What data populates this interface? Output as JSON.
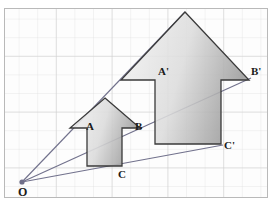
{
  "figure": {
    "background_color": "#ffffff",
    "frame": {
      "x": 4,
      "y": 8,
      "width": 264,
      "height": 190,
      "border_color": "#b8b8b8",
      "fill_color": "#fdfdfd"
    },
    "grid": {
      "spacing": 18.6,
      "line_color": "#dcdcdc",
      "major_line_color": "#cfcfcf",
      "visible": true
    },
    "center_point": {
      "label": "O",
      "x": 22,
      "y": 182,
      "dot_color": "#6f6f8a",
      "dot_radius": 2.6
    },
    "shapes": [
      {
        "name": "pre-image-arrow",
        "label_set": [
          "A",
          "B",
          "C"
        ],
        "stroke_color": "#3a3a3a",
        "fill_start": "#f2f2f2",
        "fill_end": "#9a9a9a",
        "points": "105,98 140,128 122,128 122,166 87,166 87,128 70,128",
        "vertices": {
          "A": {
            "x": 87,
            "y": 128
          },
          "B": {
            "x": 122,
            "y": 128
          },
          "C": {
            "x": 122,
            "y": 166
          }
        }
      },
      {
        "name": "image-arrow",
        "label_set": [
          "A'",
          "B'",
          "C'"
        ],
        "stroke_color": "#3a3a3a",
        "fill_start": "#f2f2f2",
        "fill_end": "#9a9a9a",
        "points": "185,12 249,80 221,80 221,144 155,144 155,80 121,80",
        "vertices": {
          "A'": {
            "x": 155,
            "y": 80
          },
          "B'": {
            "x": 221,
            "y": 80
          },
          "C'": {
            "x": 221,
            "y": 144
          }
        }
      }
    ],
    "rays": [
      {
        "name": "ray-O-to-A-prime",
        "from": "O",
        "through": "A",
        "to": "A'",
        "x1": 22,
        "y1": 182,
        "x2": 185,
        "y2": 12,
        "color": "#6f6f8a"
      },
      {
        "name": "ray-O-to-B-prime",
        "from": "O",
        "through": "B",
        "to": "B'",
        "x1": 22,
        "y1": 182,
        "x2": 250,
        "y2": 78,
        "color": "#6f6f8a"
      },
      {
        "name": "ray-O-to-C-prime",
        "from": "O",
        "through": "C",
        "to": "C'",
        "x1": 22,
        "y1": 182,
        "x2": 222,
        "y2": 144,
        "color": "#6f6f8a"
      }
    ],
    "labels": [
      {
        "name": "label-A",
        "text": "A",
        "x": 86,
        "y": 121
      },
      {
        "name": "label-B",
        "text": "B",
        "x": 135,
        "y": 121
      },
      {
        "name": "label-C",
        "text": "C",
        "x": 118,
        "y": 169
      },
      {
        "name": "label-A-prime",
        "text": "A'",
        "x": 158,
        "y": 66
      },
      {
        "name": "label-B-prime",
        "text": "B'",
        "x": 251,
        "y": 66
      },
      {
        "name": "label-C-prime",
        "text": "C'",
        "x": 224,
        "y": 140
      },
      {
        "name": "label-O",
        "text": "O",
        "x": 18,
        "y": 186
      }
    ],
    "caption": ""
  }
}
